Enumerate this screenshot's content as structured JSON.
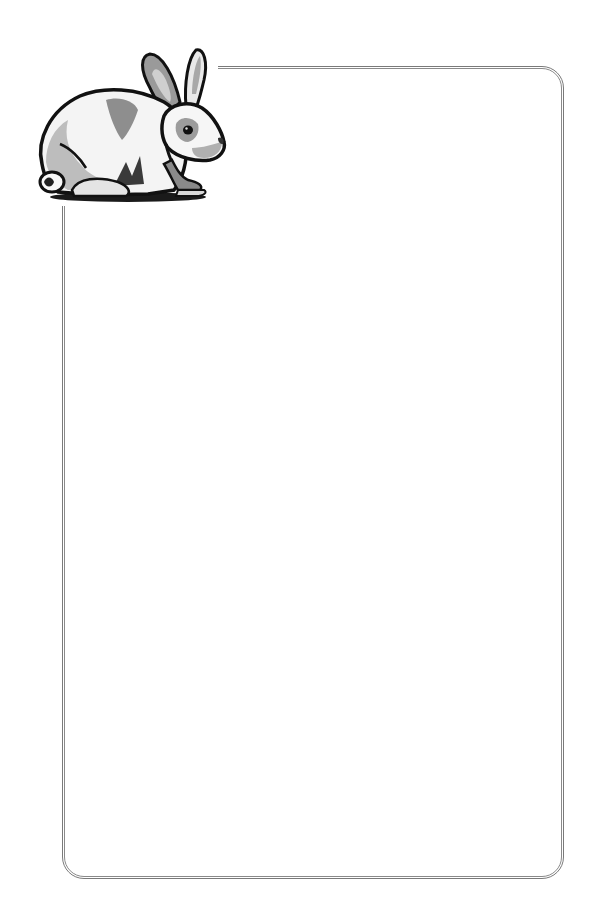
{
  "page": {
    "type": "decorative-stationery",
    "background_color": "#ffffff",
    "frame": {
      "style": "double-line rounded rectangle",
      "line_color": "#7a7a7a",
      "corner_radius_px": 22
    },
    "clipart": {
      "icon": "rabbit-icon",
      "description": "Grayscale woodcut-style illustration of a crouching white rabbit with grey patches, facing right",
      "position": "top-left corner, overlapping the frame"
    },
    "body_text": ""
  }
}
